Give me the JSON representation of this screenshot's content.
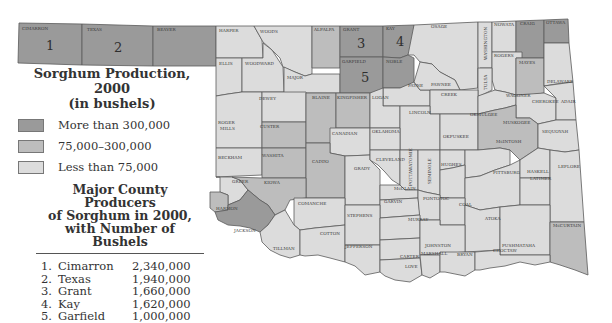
{
  "legend": {
    "title_line1": "Sorghum Production, 2000",
    "title_line2": "(in bushels)",
    "items": [
      {
        "label": "More than 300,000",
        "color": "#9a9a9a"
      },
      {
        "label": "75,000–300,000",
        "color": "#bdbdbd"
      },
      {
        "label": "Less than 75,000",
        "color": "#dcdcdc"
      }
    ]
  },
  "producers": {
    "title_line1": "Major County Producers",
    "title_line2": "of Sorghum in 2000,",
    "title_line3": "with Number of Bushels",
    "rows": [
      {
        "rank": "1.",
        "county": "Cimarron",
        "bushels": "2,340,000"
      },
      {
        "rank": "2.",
        "county": "Texas",
        "bushels": "1,940,000"
      },
      {
        "rank": "3.",
        "county": "Grant",
        "bushels": "1,660,000"
      },
      {
        "rank": "4.",
        "county": "Kay",
        "bushels": "1,620,000"
      },
      {
        "rank": "5.",
        "county": "Garfield",
        "bushels": "1,000,000"
      }
    ]
  },
  "map": {
    "rank_labels": {
      "cimarron": "1",
      "texas": "2",
      "grant": "3",
      "kay": "4",
      "garfield": "5"
    },
    "counties": {
      "cimarron": "CIMARRON",
      "texas": "TEXAS",
      "beaver": "BEAVER",
      "harper": "HARPER",
      "woods": "WOODS",
      "alfalfa": "ALFALFA",
      "grant": "GRANT",
      "kay": "KAY",
      "osage": "OSAGE",
      "nowata": "NOWATA",
      "craig": "CRAIG",
      "ottawa": "OTTAWA",
      "ellis": "ELLIS",
      "woodward": "WOODWARD",
      "major": "MAJOR",
      "garfield": "GARFIELD",
      "noble": "NOBLE",
      "washington": "WASHINGTON",
      "rogers": "ROGERS",
      "mayes": "MAYES",
      "delaware": "DELAWARE",
      "tulsa": "TULSA",
      "pawnee": "PAWNEE",
      "payne": "PAYNE",
      "creek": "CREEK",
      "wagoner": "WAGONER",
      "cherokee": "CHEROKEE",
      "adair": "ADAIR",
      "dewey": "DEWEY",
      "blaine": "BLAINE",
      "kingfisher": "KINGFISHER",
      "logan": "LOGAN",
      "lincoln": "LINCOLN",
      "roger_mills_1": "ROGER",
      "roger_mills_2": "MILLS",
      "custer": "CUSTER",
      "canadian": "CANADIAN",
      "oklahoma": "OKLAHOMA",
      "okmulgee": "OKMULGEE",
      "muskogee": "MUSKOGEE",
      "sequoyah": "SEQUOYAH",
      "okfuskee": "OKFUSKEE",
      "mcintosh": "McINTOSH",
      "beckham": "BECKHAM",
      "washita": "WASHITA",
      "caddo": "CADDO",
      "grady": "GRADY",
      "cleveland": "CLEVELAND",
      "pottawatomie": "POTTAWATOMIE",
      "seminole": "SEMINOLE",
      "hughes": "HUGHES",
      "pittsburg": "PITTSBURG",
      "haskell": "HASKELL",
      "latimer": "LATIMER",
      "leflore": "LEFLORE",
      "greer": "GREER",
      "kiowa": "KIOWA",
      "harmon": "HARMON",
      "jackson": "JACKSON",
      "comanche": "COMANCHE",
      "mcclain": "McCLAIN",
      "garvin": "GARVIN",
      "pontotoc": "PONTOTOC",
      "coal": "COAL",
      "atoka": "ATOKA",
      "tillman": "TILLMAN",
      "cotton": "COTTON",
      "stephens": "STEPHENS",
      "jefferson": "JEFFERSON",
      "murray": "MURRAY",
      "carter": "CARTER",
      "johnston": "JOHNSTON",
      "pushmataha": "PUSHMATAHA",
      "mccurtain": "McCURTAIN",
      "love": "LOVE",
      "marshall": "MARSHALL",
      "bryan": "BRYAN",
      "choctaw": "CHOCTAW"
    }
  }
}
